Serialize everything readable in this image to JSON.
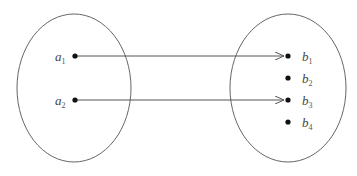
{
  "diagram": {
    "type": "mapping",
    "colors": {
      "stroke": "#555555",
      "dot": "#111111",
      "text": "#444444"
    },
    "domain_set": {
      "elements": [
        {
          "base": "a",
          "sub": "1",
          "x": 75,
          "y": 56
        },
        {
          "base": "a",
          "sub": "2",
          "x": 75,
          "y": 100
        }
      ]
    },
    "codomain_set": {
      "elements": [
        {
          "base": "b",
          "sub": "1",
          "x": 288,
          "y": 55
        },
        {
          "base": "b",
          "sub": "2",
          "x": 288,
          "y": 78
        },
        {
          "base": "b",
          "sub": "3",
          "x": 288,
          "y": 99
        },
        {
          "base": "b",
          "sub": "4",
          "x": 288,
          "y": 122
        }
      ]
    },
    "arrows": [
      {
        "from": "a1",
        "to": "b1"
      },
      {
        "from": "a2",
        "to": "b3"
      }
    ]
  }
}
